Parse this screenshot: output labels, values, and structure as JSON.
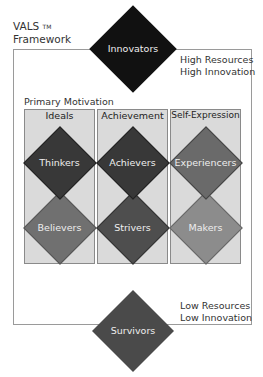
{
  "title": {
    "line1": "VALS",
    "tm": "TM",
    "line2": "Framework"
  },
  "top_label": {
    "line1": "High Resources",
    "line2": "High Innovation"
  },
  "bottom_label": {
    "line1": "Low Resources",
    "line2": "Low Innovation"
  },
  "primary_motivation": "Primary Motivation",
  "columns": [
    {
      "header": "Ideals",
      "upper": "Thinkers",
      "lower": "Believers"
    },
    {
      "header": "Achievement",
      "upper": "Achievers",
      "lower": "Strivers"
    },
    {
      "header": "Self-Expression",
      "upper": "Experiencers",
      "lower": "Makers"
    }
  ],
  "top_segment": "Innovators",
  "bottom_segment": "Survivors",
  "colors": {
    "innovators": "#111111",
    "thinkers": "#383838",
    "achievers": "#383838",
    "experiencers": "#6a6a6a",
    "believers": "#707070",
    "strivers": "#4e4e4e",
    "makers": "#8c8c8c",
    "survivors": "#4a4a4a",
    "column_bg": "#dadada"
  }
}
